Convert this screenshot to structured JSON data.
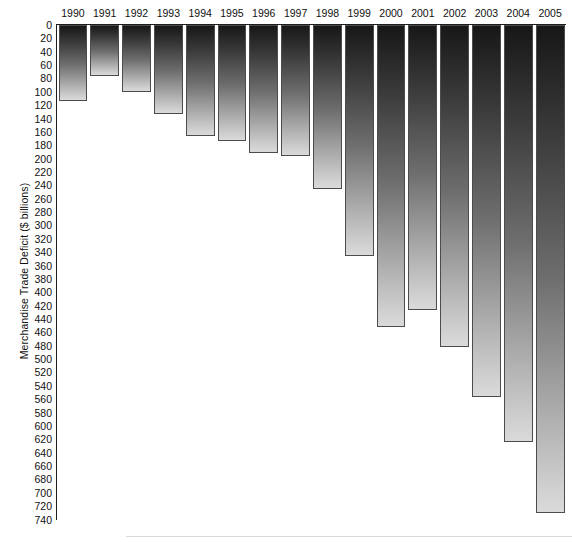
{
  "chart_data": {
    "type": "bar",
    "title": "",
    "subtitle": "",
    "xlabel": "",
    "ylabel": "Merchandise Trade Deficit ($ billions)",
    "categories": [
      "1990",
      "1991",
      "1992",
      "1993",
      "1994",
      "1995",
      "1996",
      "1997",
      "1998",
      "1999",
      "2000",
      "2001",
      "2002",
      "2003",
      "2004",
      "2005"
    ],
    "values": [
      113,
      77,
      100,
      133,
      166,
      174,
      191,
      196,
      246,
      346,
      452,
      427,
      482,
      557,
      624,
      730
    ],
    "ylim": [
      0,
      740
    ],
    "y_tick_step": 20,
    "y_ticks": [
      0,
      20,
      40,
      60,
      80,
      100,
      120,
      140,
      160,
      180,
      200,
      220,
      240,
      260,
      280,
      300,
      320,
      340,
      360,
      380,
      400,
      420,
      440,
      460,
      480,
      500,
      520,
      540,
      560,
      580,
      600,
      620,
      640,
      660,
      680,
      700,
      720,
      740
    ],
    "y_axis_inverted": true,
    "grid": false,
    "legend": null,
    "legend_position": "none",
    "bar_gradient_top_color": "#171717",
    "bar_gradient_bottom_color": "#d8d8d8",
    "bar_border_color": "#4c4c4c",
    "axis_color": "#1c1c1c",
    "background_color": "#ffffff"
  }
}
